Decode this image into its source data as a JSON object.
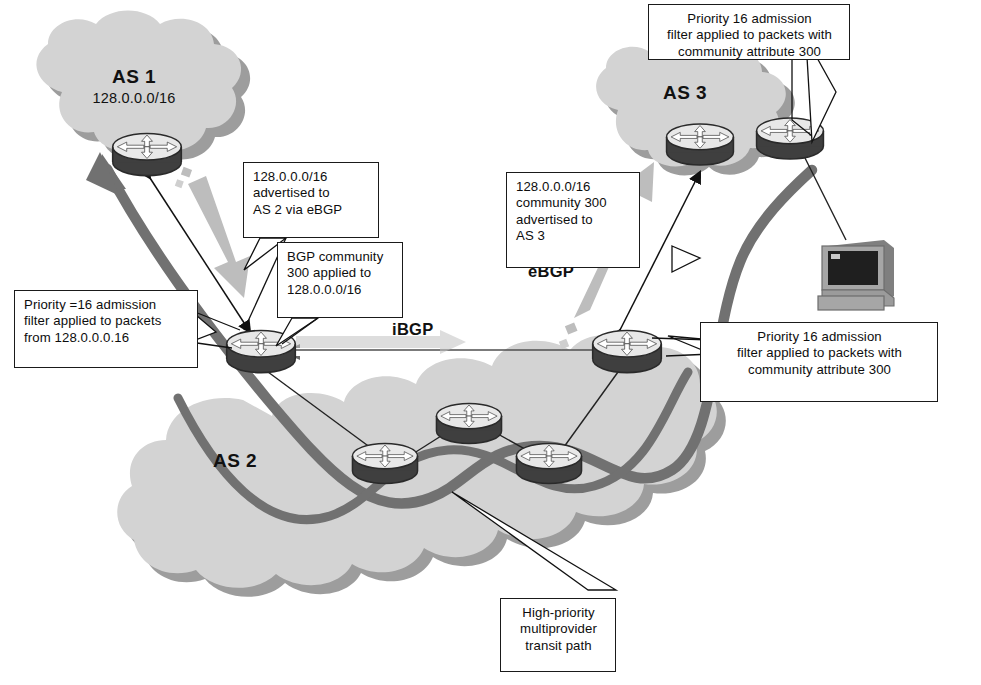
{
  "diagram": {
    "colors": {
      "cloud_fill": "#d2d2d2",
      "cloud_shadow": "#8f8f8f",
      "router_top": "#ededed",
      "router_body": "#4a4a4a",
      "transit_path": "#6e6e6e",
      "ebgp_arrow": "#bdbdbd",
      "ibgp_arrow": "#c9c9c9",
      "line": "#1a1a1a",
      "terminal_body": "#9a9a9a",
      "terminal_screen": "#1c1c1c"
    }
  },
  "clouds": [
    {
      "id": "as1",
      "as": "AS 1",
      "prefix": "128.0.0.0/16"
    },
    {
      "id": "as2",
      "as": "AS 2",
      "prefix": ""
    },
    {
      "id": "as3",
      "as": "AS 3",
      "prefix": ""
    }
  ],
  "protocol_labels": [
    {
      "id": "ibgp",
      "text": "iBGP"
    },
    {
      "id": "ebgp",
      "text": "eBGP"
    }
  ],
  "callouts": [
    {
      "id": "as3-filter",
      "lines": [
        "Priority 16 admission",
        "filter  applied to packets with",
        "community attribute 300"
      ],
      "align": "center"
    },
    {
      "id": "advertised-as2",
      "lines": [
        "128.0.0.0/16",
        "advertised to",
        "AS 2 via eBGP"
      ],
      "align": "left"
    },
    {
      "id": "community-applied",
      "lines": [
        "BGP community",
        "300 applied to",
        "128.0.0.0/16"
      ],
      "align": "left"
    },
    {
      "id": "as1-filter",
      "lines": [
        "Priority =16 admission",
        "filter applied to packets",
        "from 128.0.0.0.16"
      ],
      "align": "left"
    },
    {
      "id": "advertised-as3",
      "lines": [
        "128.0.0.0/16",
        "community 300",
        "advertised to",
        "AS 3"
      ],
      "align": "left"
    },
    {
      "id": "as2-egress-filter",
      "lines": [
        "Priority 16 admission",
        "filter  applied to packets with",
        "community attribute 300"
      ],
      "align": "center"
    },
    {
      "id": "transit-path",
      "lines": [
        "High-priority",
        "multiprovider",
        "transit path"
      ],
      "align": "center"
    }
  ],
  "routers": [
    {
      "id": "as1-border",
      "cloud": "AS 1"
    },
    {
      "id": "as2-left-border",
      "cloud": "AS 2"
    },
    {
      "id": "as2-core-left",
      "cloud": "AS 2"
    },
    {
      "id": "as2-core-top",
      "cloud": "AS 2"
    },
    {
      "id": "as2-core-right",
      "cloud": "AS 2"
    },
    {
      "id": "as2-right-border",
      "cloud": "AS 2"
    },
    {
      "id": "as3-left",
      "cloud": "AS 3"
    },
    {
      "id": "as3-right",
      "cloud": "AS 3"
    }
  ],
  "endpoints": [
    {
      "id": "workstation",
      "icon": "computer-terminal-icon"
    }
  ]
}
